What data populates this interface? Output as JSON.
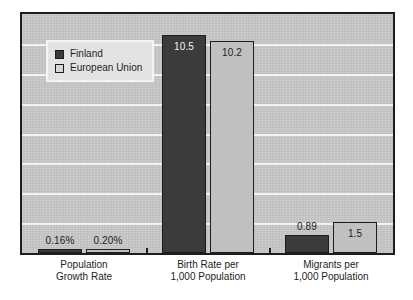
{
  "chart_data": {
    "type": "bar",
    "title": "",
    "subtitle": "",
    "xlabel": "",
    "ylabel": "",
    "grid": true,
    "legend_position": "top-left",
    "ylim": [
      0,
      11.5
    ],
    "categories": [
      "Population\nGrowth Rate",
      "Birth Rate per\n1,000 Population",
      "Migrants per\n1,000 Population"
    ],
    "category_lines": [
      [
        "Population",
        "Growth Rate"
      ],
      [
        "Birth Rate per",
        "1,000 Population"
      ],
      [
        "Migrants per",
        "1,000 Population"
      ]
    ],
    "series": [
      {
        "name": "Finland",
        "color": "#3b3b3b",
        "values": [
          0.16,
          10.5,
          0.89
        ],
        "labels": [
          "0.16%",
          "10.5",
          "0.89"
        ]
      },
      {
        "name": "European Union",
        "color": "#c0c0c0",
        "values": [
          0.2,
          10.2,
          1.5
        ],
        "labels": [
          "0.20%",
          "10.2",
          "1.5"
        ]
      }
    ],
    "gridline_count": 7
  },
  "legend": {
    "items": [
      {
        "label": "Finland",
        "swatch": "dark"
      },
      {
        "label": "European Union",
        "swatch": "light"
      }
    ]
  },
  "colors": {
    "plot_background": "#c9c9c9",
    "gridline": "#f2f2f2",
    "axis": "#1d1d1d",
    "series_finland": "#3b3b3b",
    "series_eu": "#c0c0c0",
    "page_background": "#ffffff"
  }
}
